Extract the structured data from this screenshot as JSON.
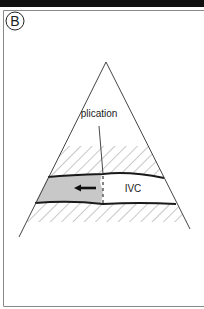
{
  "panel": {
    "label": "B"
  },
  "diagram": {
    "labels": {
      "plication": "plication",
      "vessel": "IVC"
    },
    "colors": {
      "line": "#333333",
      "thick_line": "#1a1a1a",
      "hatch": "#9a9a9a",
      "fill_shaded": "#c8c8c8",
      "frame": "#8a8a8a",
      "topbar": "#111111"
    },
    "arrow_direction": "left"
  }
}
